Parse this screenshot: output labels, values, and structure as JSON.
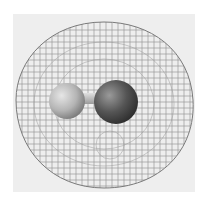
{
  "figure": {
    "representation": "wireframe mesh surrounding ball-and-stick diatomic molecule",
    "colors": {
      "background": "#ffffff",
      "panel": "#eeeeee",
      "mesh": "#8a8a8a",
      "atom_left": "#b8b8b8",
      "atom_right": "#555555",
      "bond": "#bdbdbd"
    },
    "atoms": [
      {
        "position": "left",
        "shade": "light"
      },
      {
        "position": "right",
        "shade": "dark"
      }
    ]
  }
}
